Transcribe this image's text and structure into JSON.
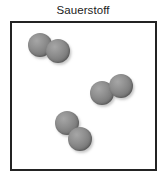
{
  "figure": {
    "title": "Sauerstoff",
    "substance_name": "Sauerstoff",
    "molecule_type": "diatomic",
    "atoms_per_molecule": 2,
    "molecule_count": 3,
    "atom_count": 6,
    "atom_color": "#8d8d8d",
    "atom_highlight_color": "#a6a6a6",
    "atom_shadow_color": "#5e5e5e",
    "atom_radius_px": 12,
    "box": {
      "border_color": "#232323",
      "border_width_px": 2,
      "fill_color": "#ffffff",
      "x": 10,
      "y": 21,
      "width": 147,
      "height": 150
    },
    "background_color": "#ffffff",
    "title_color": "#1b1b1b"
  },
  "molecules": [
    {
      "id": "molecule-1",
      "label": "O2",
      "position": "top-left",
      "atoms": [
        {
          "id": "atom-1a",
          "cx": 28,
          "cy": 22
        },
        {
          "id": "atom-1b",
          "cx": 46,
          "cy": 28
        }
      ]
    },
    {
      "id": "molecule-2",
      "label": "O2",
      "position": "middle-right",
      "atoms": [
        {
          "id": "atom-2a",
          "cx": 90,
          "cy": 70
        },
        {
          "id": "atom-2b",
          "cx": 109,
          "cy": 63
        }
      ]
    },
    {
      "id": "molecule-3",
      "label": "O2",
      "position": "bottom-center",
      "atoms": [
        {
          "id": "atom-3a",
          "cx": 55,
          "cy": 100
        },
        {
          "id": "atom-3b",
          "cx": 68,
          "cy": 116
        }
      ]
    }
  ]
}
